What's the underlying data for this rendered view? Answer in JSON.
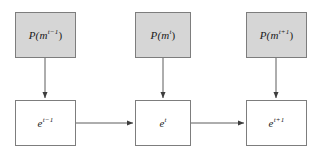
{
  "diagram": {
    "background_color": "#ffffff",
    "node_fill_shaded": "#d6d6d6",
    "node_fill_plain": "#ffffff",
    "node_border_color": "#7d7d7d",
    "edge_color": "#4a4a4a",
    "observation_nodes": [
      {
        "id": "obs-t-minus-1",
        "base": "P(m",
        "superscript": "t−1",
        "close": ")",
        "full_label": "P(m^{t-1})",
        "x": 15,
        "y": 12,
        "width": 61,
        "height": 46
      },
      {
        "id": "obs-t",
        "base": "P(m",
        "superscript": "t",
        "close": ")",
        "full_label": "P(m^{t})",
        "x": 135,
        "y": 12,
        "width": 56,
        "height": 46
      },
      {
        "id": "obs-t-plus-1",
        "base": "P(m",
        "superscript": "t+1",
        "close": ")",
        "full_label": "P(m^{t+1})",
        "x": 246,
        "y": 12,
        "width": 61,
        "height": 46
      }
    ],
    "state_nodes": [
      {
        "id": "state-t-minus-1",
        "base": "e",
        "superscript": "t−1",
        "close": "",
        "full_label": "e^{t-1}",
        "x": 15,
        "y": 100,
        "width": 61,
        "height": 46
      },
      {
        "id": "state-t",
        "base": "e",
        "superscript": "t",
        "close": "",
        "full_label": "e^{t}",
        "x": 135,
        "y": 100,
        "width": 56,
        "height": 46
      },
      {
        "id": "state-t-plus-1",
        "base": "e",
        "superscript": "t+1",
        "close": "",
        "full_label": "e^{t+1}",
        "x": 246,
        "y": 100,
        "width": 61,
        "height": 46
      }
    ],
    "vertical_arrows": [
      {
        "id": "arrow-down-t-minus-1",
        "x": 45,
        "y_start": 58,
        "y_end": 99
      },
      {
        "id": "arrow-down-t",
        "x": 163,
        "y_start": 58,
        "y_end": 99
      },
      {
        "id": "arrow-down-t-plus-1",
        "x": 276,
        "y_start": 58,
        "y_end": 99
      }
    ],
    "horizontal_arrows": [
      {
        "id": "arrow-right-1",
        "y": 123,
        "x_start": 76,
        "x_end": 134
      },
      {
        "id": "arrow-right-2",
        "y": 123,
        "x_start": 191,
        "x_end": 245
      }
    ]
  }
}
